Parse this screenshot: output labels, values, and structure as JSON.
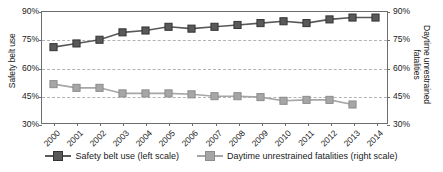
{
  "chart_data": {
    "type": "line",
    "title": "",
    "xlabel": "",
    "ylabel": "Safety belt use",
    "y2label": "Daytime unrestrained fatalities",
    "categories": [
      "2000",
      "2001",
      "2002",
      "2003",
      "2004",
      "2005",
      "2006",
      "2007",
      "2008",
      "2009",
      "2010",
      "2011",
      "2012",
      "2013",
      "2014"
    ],
    "ylim": [
      30,
      90
    ],
    "y2lim": [
      30,
      90
    ],
    "yticks": [
      "30%",
      "45%",
      "60%",
      "75%",
      "90%"
    ],
    "ytick_values": [
      30,
      45,
      60,
      75,
      90
    ],
    "y2ticks": [
      "30%",
      "45%",
      "60%",
      "75%",
      "90%"
    ],
    "y2tick_values": [
      30,
      45,
      60,
      75,
      90
    ],
    "grid": true,
    "legend_position": "bottom",
    "series": [
      {
        "name": "Safety belt use (left scale)",
        "axis": "left",
        "color": "#595959",
        "marker": "square",
        "values": [
          71,
          73,
          75,
          79,
          80,
          82,
          81,
          82,
          83,
          84,
          85,
          84,
          86,
          87,
          87
        ]
      },
      {
        "name": "Daytime unrestrained fatalities (right scale)",
        "axis": "right",
        "color": "#a6a6a6",
        "marker": "square",
        "values": [
          51,
          49,
          49,
          46,
          46,
          46,
          45.5,
          44.5,
          44.5,
          44,
          42,
          42.5,
          42.5,
          40,
          null
        ]
      }
    ]
  },
  "legend": {
    "items": [
      {
        "label": "Safety belt use (left scale)",
        "color": "#595959"
      },
      {
        "label": "Daytime unrestrained fatalities (right scale)",
        "color": "#a6a6a6"
      }
    ]
  },
  "colors": {
    "dark_series": "#595959",
    "light_series": "#a6a6a6",
    "axis": "#6e6e6e",
    "grid": "#b3b3b3",
    "text": "#1a1a1a"
  }
}
